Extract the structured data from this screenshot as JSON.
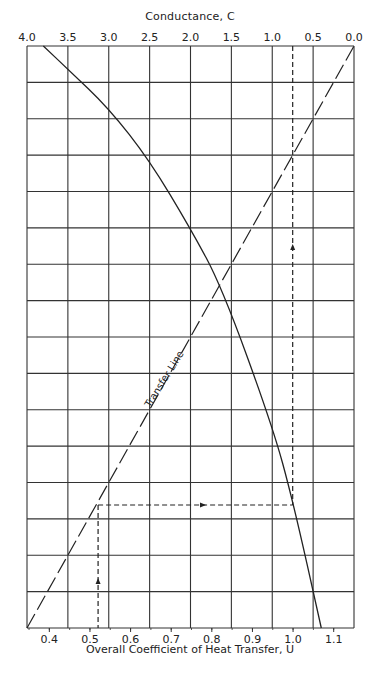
{
  "chart_data": {
    "type": "line",
    "title": "Conductance, C",
    "xlabel": "Overall Coefficient of Heat Transfer, U",
    "ylabel": "",
    "top_axis": {
      "label": "Conductance, C",
      "ticks": [
        "4.0",
        "3.5",
        "3.0",
        "2.5",
        "2.0",
        "1.5",
        "1.0",
        "0.5",
        "0.0"
      ],
      "range": [
        4.0,
        0.0
      ]
    },
    "bottom_axis": {
      "label": "Overall Coefficient of Heat Transfer, U",
      "ticks": [
        "0.4",
        "0.5",
        "0.6",
        "0.7",
        "0.8",
        "0.9",
        "1.0",
        "1.1"
      ],
      "range": [
        0.345,
        1.15
      ]
    },
    "grid": true,
    "horizontal_grid_intervals": 16,
    "series": [
      {
        "name": "C vs U curve",
        "style": "solid",
        "points_C_top_axis": [
          3.8,
          3.5,
          3.0,
          2.5,
          2.0,
          1.62,
          1.0,
          0.75,
          0.4
        ],
        "points_row_fraction_from_top": [
          0.0,
          0.04,
          0.107,
          0.197,
          0.314,
          0.413,
          0.652,
          0.78,
          1.0
        ]
      },
      {
        "name": "Transfer Line",
        "style": "dashed",
        "from": {
          "U": 0.345,
          "row_fraction_from_top": 1.0
        },
        "to": {
          "C": 0.0,
          "row_fraction_from_top": 0.0
        }
      }
    ],
    "annotations": [
      {
        "text": "Transfer Line",
        "type": "label",
        "rotated": true
      },
      {
        "type": "dashed-path",
        "description": "From C≈0.75 on top axis down to curve, across horizontally to Transfer Line, down to U≈0.52 on bottom axis",
        "C_start": 0.75,
        "U_end": 0.52
      }
    ]
  },
  "labels": {
    "top_title": "Conductance, C",
    "bottom_title": "Overall Coefficient of Heat Transfer, U",
    "transfer_line": "Transfer Line"
  }
}
